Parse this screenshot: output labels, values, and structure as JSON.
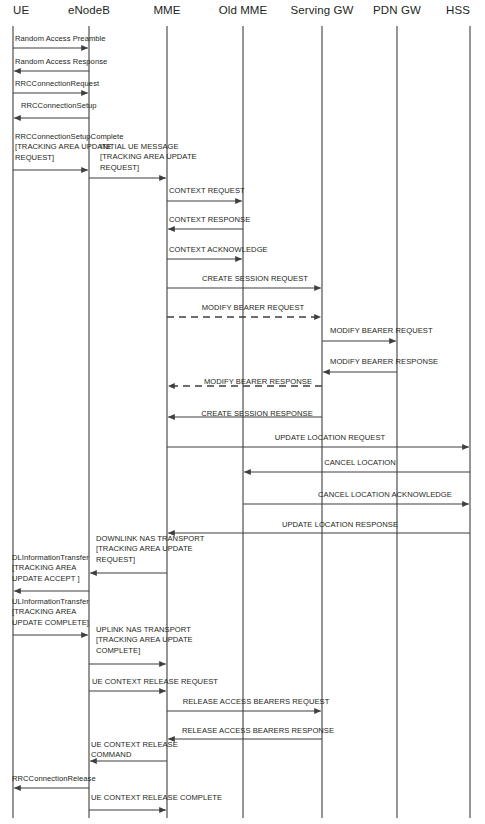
{
  "diagram": {
    "width": 485,
    "height": 824,
    "background_color": "#ffffff",
    "line_color": "#3f3f3f",
    "text_color": "#231f20"
  },
  "actors": [
    {
      "id": "ue",
      "label": "UE",
      "x": 13,
      "label_anchor": "left"
    },
    {
      "id": "enodeb",
      "label": "eNodeB",
      "x": 89,
      "label_anchor": "center"
    },
    {
      "id": "mme",
      "label": "MME",
      "x": 167,
      "label_anchor": "center"
    },
    {
      "id": "oldmme",
      "label": "Old MME",
      "x": 243,
      "label_anchor": "center"
    },
    {
      "id": "sgw",
      "label": "Serving GW",
      "x": 322,
      "label_anchor": "center"
    },
    {
      "id": "pgw",
      "label": "PDN GW",
      "x": 397,
      "label_anchor": "center"
    },
    {
      "id": "hss",
      "label": "HSS",
      "x": 470,
      "label_anchor": "right"
    }
  ],
  "lifeline": {
    "top": 26,
    "bottom": 818
  },
  "messages": [
    {
      "id": "m01",
      "label": "Random Access Preamble",
      "from": "ue",
      "to": "enodeb",
      "y": 48,
      "style": "solid",
      "label_x": 15,
      "label_y": 34,
      "align": "left"
    },
    {
      "id": "m02",
      "label": "Random Access Response",
      "from": "enodeb",
      "to": "ue",
      "y": 71,
      "style": "solid",
      "label_x": 15,
      "label_y": 57,
      "align": "left"
    },
    {
      "id": "m03",
      "label": "RRCConnectionRequest",
      "from": "ue",
      "to": "enodeb",
      "y": 93,
      "style": "solid",
      "label_x": 15,
      "label_y": 79,
      "align": "left"
    },
    {
      "id": "m04",
      "label": "RRCConnectionSetup",
      "from": "enodeb",
      "to": "ue",
      "y": 118,
      "style": "solid",
      "label_x": 21,
      "label_y": 101,
      "align": "left"
    },
    {
      "id": "m05",
      "label": "RRCConnectionSetupComplete\n[TRACKING AREA UPDATE\nREQUEST]",
      "from": "ue",
      "to": "enodeb",
      "y": 170,
      "style": "solid",
      "label_x": 15,
      "label_y": 132,
      "align": "left"
    },
    {
      "id": "m06",
      "label": "INITIAL UE MESSAGE\n[TRACKING AREA UPDATE\nREQUEST]",
      "from": "enodeb",
      "to": "mme",
      "y": 178,
      "style": "solid",
      "label_x": 100,
      "label_y": 142,
      "align": "left"
    },
    {
      "id": "m07",
      "label": "CONTEXT REQUEST",
      "from": "mme",
      "to": "oldmme",
      "y": 201,
      "style": "solid",
      "label_x": 169,
      "label_y": 186,
      "align": "left"
    },
    {
      "id": "m08",
      "label": "CONTEXT RESPONSE",
      "from": "oldmme",
      "to": "mme",
      "y": 229,
      "style": "solid",
      "label_x": 169,
      "label_y": 215,
      "align": "left"
    },
    {
      "id": "m09",
      "label": "CONTEXT ACKNOWLEDGE",
      "from": "mme",
      "to": "oldmme",
      "y": 259,
      "style": "solid",
      "label_x": 169,
      "label_y": 245,
      "align": "left"
    },
    {
      "id": "m10",
      "label": "CREATE SESSION REQUEST",
      "from": "mme",
      "to": "sgw",
      "y": 288,
      "style": "solid",
      "label_x": 255,
      "label_y": 274,
      "align": "center"
    },
    {
      "id": "m11",
      "label": "MODIFY BEARER REQUEST",
      "from": "mme",
      "to": "sgw",
      "y": 317,
      "style": "dashed",
      "label_x": 253,
      "label_y": 303,
      "align": "center"
    },
    {
      "id": "m12",
      "label": "MODIFY BEARER REQUEST",
      "from": "sgw",
      "to": "pgw",
      "y": 341,
      "style": "solid",
      "label_x": 330,
      "label_y": 326,
      "align": "left"
    },
    {
      "id": "m13",
      "label": "MODIFY BEARER RESPONSE",
      "from": "pgw",
      "to": "sgw",
      "y": 372,
      "style": "solid",
      "label_x": 330,
      "label_y": 357,
      "align": "left"
    },
    {
      "id": "m14",
      "label": "MODIFY BEARER RESPONSE",
      "from": "sgw",
      "to": "mme",
      "y": 386,
      "style": "dashed",
      "label_x": 258,
      "label_y": 377,
      "align": "center"
    },
    {
      "id": "m15",
      "label": "CREATE SESSION RESPONSE",
      "from": "sgw",
      "to": "mme",
      "y": 417,
      "style": "solid",
      "label_x": 257,
      "label_y": 409,
      "align": "center"
    },
    {
      "id": "m16",
      "label": "UPDATE LOCATION REQUEST",
      "from": "mme",
      "to": "hss",
      "y": 447,
      "style": "solid",
      "label_x": 330,
      "label_y": 433,
      "align": "center"
    },
    {
      "id": "m17",
      "label": "CANCEL LOCATION",
      "from": "hss",
      "to": "oldmme",
      "y": 472,
      "style": "solid",
      "label_x": 360,
      "label_y": 458,
      "align": "center"
    },
    {
      "id": "m18",
      "label": "CANCEL LOCATION ACKNOWLEDGE",
      "from": "oldmme",
      "to": "hss",
      "y": 504,
      "style": "solid",
      "label_x": 385,
      "label_y": 490,
      "align": "center"
    },
    {
      "id": "m19",
      "label": "UPDATE LOCATION RESPONSE",
      "from": "hss",
      "to": "mme",
      "y": 533,
      "style": "solid",
      "label_x": 340,
      "label_y": 520,
      "align": "center"
    },
    {
      "id": "m20",
      "label": "DOWNLINK NAS TRANSPORT\n[TRACKING AREA UPDATE\nREQUEST]",
      "from": "mme",
      "to": "enodeb",
      "y": 573,
      "style": "solid",
      "label_x": 96,
      "label_y": 534,
      "align": "left"
    },
    {
      "id": "m21",
      "label": "DLInformationTransfer\n[TRACKING AREA\nUPDATE ACCEPT ]",
      "from": "enodeb",
      "to": "ue",
      "y": 591,
      "style": "solid",
      "label_x": 12,
      "label_y": 553,
      "align": "left"
    },
    {
      "id": "m22",
      "label": "ULInformationTransfer\n[TRACKING AREA\nUPDATE COMPLETE]",
      "from": "ue",
      "to": "enodeb",
      "y": 635,
      "style": "solid",
      "label_x": 12,
      "label_y": 597,
      "align": "left"
    },
    {
      "id": "m23",
      "label": "UPLINK NAS TRANSPORT\n[TRACKING AREA UPDATE\nCOMPLETE]",
      "from": "enodeb",
      "to": "mme",
      "y": 664,
      "style": "solid",
      "label_x": 96,
      "label_y": 625,
      "align": "left"
    },
    {
      "id": "m24",
      "label": "UE CONTEXT RELEASE REQUEST",
      "from": "enodeb",
      "to": "mme",
      "y": 691,
      "style": "solid",
      "label_x": 92,
      "label_y": 677,
      "align": "left"
    },
    {
      "id": "m25",
      "label": "RELEASE ACCESS BEARERS REQUEST",
      "from": "mme",
      "to": "sgw",
      "y": 711,
      "style": "solid",
      "label_x": 256,
      "label_y": 697,
      "align": "center"
    },
    {
      "id": "m26",
      "label": "RELEASE ACCESS BEARERS RESPONSE",
      "from": "sgw",
      "to": "mme",
      "y": 739,
      "style": "solid",
      "label_x": 258,
      "label_y": 726,
      "align": "center"
    },
    {
      "id": "m27",
      "label": "UE CONTEXT RELEASE\nCOMMAND",
      "from": "mme",
      "to": "enodeb",
      "y": 761,
      "style": "solid",
      "label_x": 91,
      "label_y": 740,
      "align": "left"
    },
    {
      "id": "m28",
      "label": "RRCConnectionRelease",
      "from": "enodeb",
      "to": "ue",
      "y": 788,
      "style": "solid",
      "label_x": 12,
      "label_y": 774,
      "align": "left"
    },
    {
      "id": "m29",
      "label": "UE CONTEXT RELEASE COMPLETE",
      "from": "enodeb",
      "to": "mme",
      "y": 810,
      "style": "solid",
      "label_x": 91,
      "label_y": 793,
      "align": "left"
    }
  ]
}
